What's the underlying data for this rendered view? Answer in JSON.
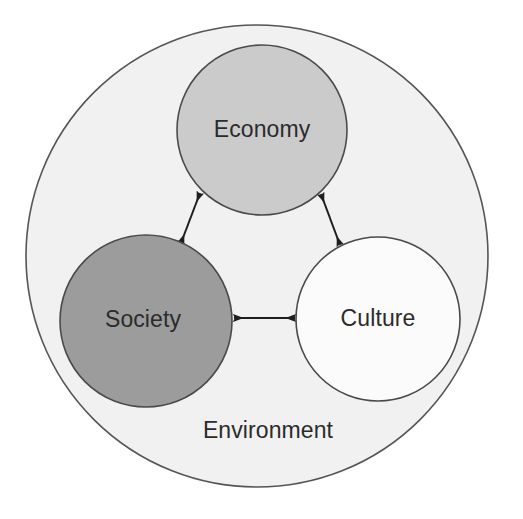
{
  "diagram": {
    "type": "venn-containment",
    "canvas": {
      "width": 523,
      "height": 519,
      "background": "#ffffff"
    },
    "container": {
      "label": "Environment",
      "shape": "circle",
      "center_x": 257,
      "center_y": 256,
      "radius": 231,
      "fill": "#f1f1f1",
      "stroke": "#555555",
      "stroke_width": 1.6,
      "label_x": 268,
      "label_y": 432
    },
    "nodes": [
      {
        "id": "economy",
        "label": "Economy",
        "shape": "circle",
        "center_x": 262,
        "center_y": 130,
        "radius": 85,
        "fill": "#cbcbcb",
        "stroke": "#4a4a4a",
        "stroke_width": 1.6,
        "label_x": 262,
        "label_y": 131
      },
      {
        "id": "society",
        "label": "Society",
        "shape": "circle",
        "center_x": 146,
        "center_y": 321,
        "radius": 86,
        "fill": "#9c9c9c",
        "stroke": "#4a4a4a",
        "stroke_width": 1.6,
        "label_x": 143,
        "label_y": 321
      },
      {
        "id": "culture",
        "label": "Culture",
        "shape": "circle",
        "center_x": 378,
        "center_y": 319,
        "radius": 82,
        "fill": "#fbfbfb",
        "stroke": "#4a4a4a",
        "stroke_width": 1.6,
        "label_x": 378,
        "label_y": 320
      }
    ],
    "connectors": [
      {
        "id": "economy-society",
        "from": "economy",
        "to": "society",
        "style": "double-headed-arrow",
        "x1": 200,
        "y1": 193,
        "x2": 181,
        "y2": 243,
        "stroke": "#1e1e1e",
        "stroke_width": 2
      },
      {
        "id": "economy-culture",
        "from": "economy",
        "to": "culture",
        "style": "double-headed-arrow",
        "x1": 321,
        "y1": 194,
        "x2": 340,
        "y2": 245,
        "stroke": "#1e1e1e",
        "stroke_width": 2
      },
      {
        "id": "society-culture",
        "from": "society",
        "to": "culture",
        "style": "double-headed-arrow",
        "x1": 234,
        "y1": 318,
        "x2": 295,
        "y2": 318,
        "stroke": "#1e1e1e",
        "stroke_width": 2
      }
    ]
  }
}
